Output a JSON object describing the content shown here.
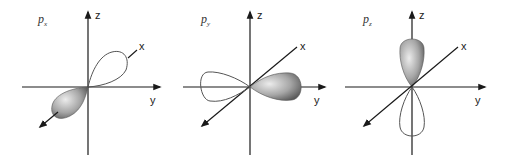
{
  "diagram": {
    "panels": [
      {
        "id": "px",
        "orbital_label": "p",
        "orbital_subscript": "x",
        "axis_labels": {
          "z": "z",
          "x": "x",
          "y": "y"
        },
        "filled_lobe_direction": "+x (toward viewer, lower-left)",
        "outline_lobe_direction": "-x (away, upper-right)"
      },
      {
        "id": "py",
        "orbital_label": "p",
        "orbital_subscript": "y",
        "axis_labels": {
          "z": "z",
          "x": "x",
          "y": "y"
        },
        "filled_lobe_direction": "+y (right)",
        "outline_lobe_direction": "-y (left)"
      },
      {
        "id": "pz",
        "orbital_label": "p",
        "orbital_subscript": "z",
        "axis_labels": {
          "z": "z",
          "x": "x",
          "y": "y"
        },
        "filled_lobe_direction": "+z (up)",
        "outline_lobe_direction": "-z (down)"
      }
    ],
    "colors": {
      "axis": "#1a1a1a",
      "lobe_fill_light": "#e6e6e6",
      "lobe_fill_dark": "#5e5e5e",
      "outline_lobe": "#555555",
      "background": "#ffffff"
    }
  }
}
